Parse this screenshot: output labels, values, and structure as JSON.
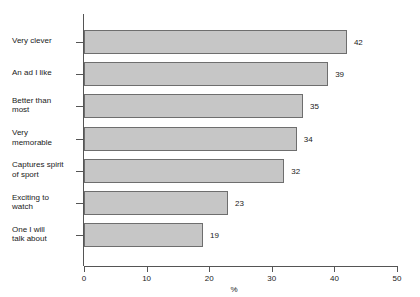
{
  "chart_data": {
    "type": "bar",
    "orientation": "horizontal",
    "title": "",
    "subtitle": "",
    "xlabel": "%",
    "ylabel": "",
    "categories": [
      "Very clever",
      "An ad I like",
      "Better than most",
      "Very memorable",
      "Captures spirit of sport",
      "Exciting to watch",
      "One I will talk about"
    ],
    "category_lines": [
      [
        "Very clever"
      ],
      [
        "An ad I like"
      ],
      [
        "Better than",
        "most"
      ],
      [
        "Very",
        "memorable"
      ],
      [
        "Captures spirit",
        "of sport"
      ],
      [
        "Exciting to",
        "watch"
      ],
      [
        "One I will",
        "talk about"
      ]
    ],
    "values": [
      42,
      39,
      35,
      34,
      32,
      23,
      19
    ],
    "data_labels": [
      "42",
      "39",
      "35",
      "34",
      "32",
      "23",
      "19"
    ],
    "xlim": [
      0,
      50
    ],
    "xticks": [
      0,
      10,
      20,
      30,
      40,
      50
    ],
    "xtick_labels": [
      "0",
      "10",
      "20",
      "30",
      "40",
      "50"
    ],
    "grid": false,
    "legend": false,
    "legend_position": "none",
    "bar_fill_color": "#c6c6c6",
    "bar_border_color": "#6e6e6e",
    "axis_color": "#555555",
    "text_color": "#1a1a1a",
    "background_color": "#ffffff"
  }
}
